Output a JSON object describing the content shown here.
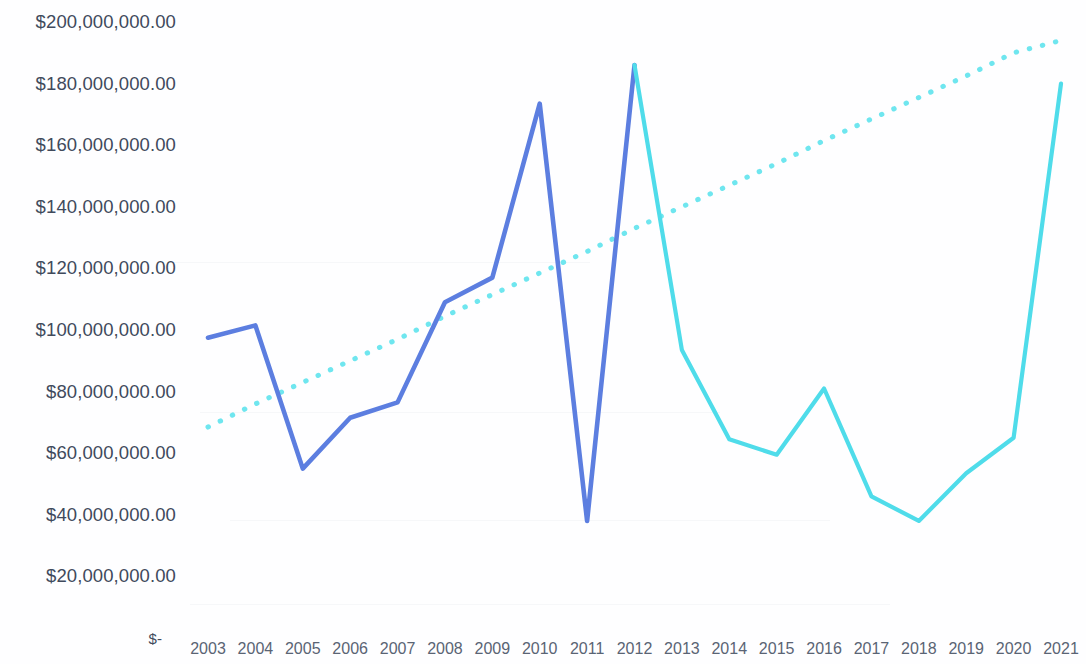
{
  "chart_data": {
    "type": "line",
    "title": "",
    "subtitle": "",
    "xlabel": "",
    "ylabel": "",
    "grid": false,
    "legend": "none",
    "x": [
      2003,
      2004,
      2005,
      2006,
      2007,
      2008,
      2009,
      2010,
      2011,
      2012,
      2013,
      2014,
      2015,
      2016,
      2017,
      2018,
      2019,
      2020,
      2021
    ],
    "categories": [
      "2003",
      "2004",
      "2005",
      "2006",
      "2007",
      "2008",
      "2009",
      "2010",
      "2011",
      "2012",
      "2013",
      "2014",
      "2015",
      "2016",
      "2017",
      "2018",
      "2019",
      "2020",
      "2021"
    ],
    "ylim": [
      0,
      200000000
    ],
    "ytick_values": [
      200000000,
      180000000,
      160000000,
      140000000,
      120000000,
      100000000,
      80000000,
      60000000,
      40000000,
      20000000,
      0
    ],
    "ytick_labels": [
      "$200,000,000.00",
      "$180,000,000.00",
      "$160,000,000.00",
      "$140,000,000.00",
      "$120,000,000.00",
      "$100,000,000.00",
      "$80,000,000.00",
      "$60,000,000.00",
      "$40,000,000.00",
      "$20,000,000.00",
      "$-"
    ],
    "series": [
      {
        "name": "Actual",
        "color": "#5c7ee0",
        "style": "solid",
        "segment": "2003-2012",
        "values": [
          97500000,
          101500000,
          55000000,
          71500000,
          76500000,
          109000000,
          117000000,
          173500000,
          38000000,
          186000000,
          null,
          null,
          null,
          null,
          null,
          null,
          null,
          null,
          null
        ]
      },
      {
        "name": "Projected",
        "color": "#4fdcea",
        "style": "solid",
        "segment": "2012-2021",
        "values": [
          null,
          null,
          null,
          null,
          null,
          null,
          null,
          null,
          null,
          186000000,
          93500000,
          64500000,
          59500000,
          81000000,
          46000000,
          38000000,
          53500000,
          65000000,
          180000000
        ]
      },
      {
        "name": "Trendline",
        "color": "#6fe6ef",
        "style": "dotted",
        "segment": "2003-2021",
        "values": [
          68500000,
          76000000,
          83000000,
          90000000,
          97000000,
          104500000,
          111500000,
          118500000,
          125500000,
          133000000,
          140000000,
          147000000,
          154000000,
          161500000,
          168500000,
          175500000,
          182500000,
          190000000,
          194000000
        ]
      }
    ]
  },
  "axis": {
    "y_labels": [
      "$200,000,000.00",
      "$180,000,000.00",
      "$160,000,000.00",
      "$140,000,000.00",
      "$120,000,000.00",
      "$100,000,000.00",
      "$80,000,000.00",
      "$60,000,000.00",
      "$40,000,000.00",
      "$20,000,000.00",
      "$-"
    ],
    "x_labels": [
      "2003",
      "2004",
      "2005",
      "2006",
      "2007",
      "2008",
      "2009",
      "2010",
      "2011",
      "2012",
      "2013",
      "2014",
      "2015",
      "2016",
      "2017",
      "2018",
      "2019",
      "2020",
      "2021"
    ]
  },
  "colors": {
    "actual": "#5c7ee0",
    "projected": "#4fdcea",
    "trend": "#6fe6ef",
    "axis_text": "#404a5c",
    "x_axis_text": "#5a6474",
    "background": "#fefeff"
  }
}
